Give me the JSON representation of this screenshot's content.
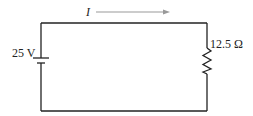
{
  "diagram": {
    "type": "circuit",
    "current": {
      "label": "I",
      "direction": "right"
    },
    "source": {
      "type": "battery",
      "label": "25 V",
      "voltage_value": 25,
      "voltage_unit": "V"
    },
    "load": {
      "type": "resistor",
      "label": "12.5 Ω",
      "resistance_value": 12.5,
      "resistance_unit": "Ω"
    },
    "colors": {
      "wire": "#222222",
      "arrow": "#999999",
      "text": "#222222"
    }
  }
}
